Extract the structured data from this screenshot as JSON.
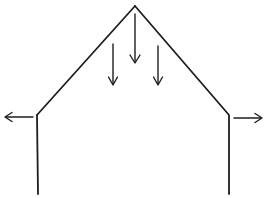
{
  "diagram": {
    "colors": {
      "background": "#ffffff",
      "line": "#1e1e1e"
    },
    "elements": [
      {
        "name": "roof-left-slope",
        "kind": "line"
      },
      {
        "name": "roof-right-slope",
        "kind": "line"
      },
      {
        "name": "left-wall",
        "kind": "line"
      },
      {
        "name": "right-wall",
        "kind": "line"
      },
      {
        "name": "down-arrow-center",
        "kind": "arrow",
        "direction": "down"
      },
      {
        "name": "down-arrow-left",
        "kind": "arrow",
        "direction": "down"
      },
      {
        "name": "down-arrow-right",
        "kind": "arrow",
        "direction": "down"
      },
      {
        "name": "outward-arrow-left",
        "kind": "arrow",
        "direction": "left"
      },
      {
        "name": "outward-arrow-right",
        "kind": "arrow",
        "direction": "right"
      }
    ]
  }
}
